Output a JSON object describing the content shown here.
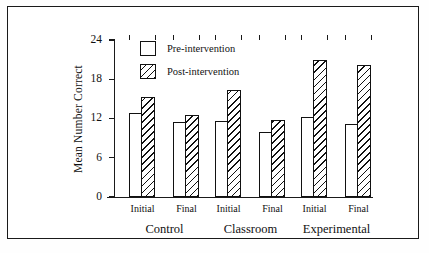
{
  "chart_data": {
    "type": "bar",
    "title": "",
    "xlabel": "",
    "ylabel": "Mean Number Correct",
    "ylim": [
      0,
      24
    ],
    "yticks": [
      0,
      6,
      12,
      18,
      24
    ],
    "ytick_labels": [
      "0",
      "6",
      "12",
      "18",
      "24"
    ],
    "grid": false,
    "legend_position": "top-left-inside",
    "categories": [
      "Control Initial",
      "Control Final",
      "Classroom Initial",
      "Classroom Final",
      "Experimental Initial",
      "Experimental Final"
    ],
    "groups": [
      {
        "label": "Control",
        "conditions": [
          {
            "label": "Initial",
            "pre": 12.8,
            "post": 15.3
          },
          {
            "label": "Final",
            "pre": 11.5,
            "post": 12.5
          }
        ]
      },
      {
        "label": "Classroom",
        "conditions": [
          {
            "label": "Initial",
            "pre": 11.6,
            "post": 16.3
          },
          {
            "label": "Final",
            "pre": 10.0,
            "post": 11.8
          }
        ]
      },
      {
        "label": "Experimental",
        "conditions": [
          {
            "label": "Initial",
            "pre": 12.2,
            "post": 21.0
          },
          {
            "label": "Final",
            "pre": 11.2,
            "post": 20.2
          }
        ]
      }
    ],
    "series": [
      {
        "name": "Pre-intervention",
        "values": [
          12.8,
          11.5,
          11.6,
          10.0,
          12.2,
          11.2
        ]
      },
      {
        "name": "Post-intervention",
        "values": [
          15.3,
          12.5,
          16.3,
          11.8,
          21.0,
          20.2
        ]
      }
    ]
  },
  "legend": {
    "items": [
      {
        "label": "Pre-intervention",
        "fill": "solid-white"
      },
      {
        "label": "Post-intervention",
        "fill": "diagonal-hatch"
      }
    ]
  },
  "colors": {
    "ink": "#111111",
    "background": "#ffffff",
    "frame": "#1a1a1a"
  }
}
